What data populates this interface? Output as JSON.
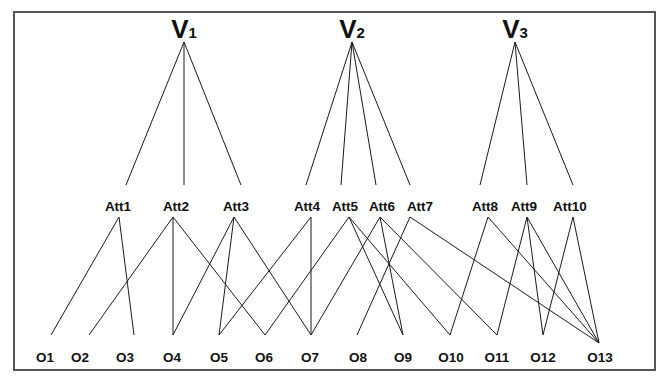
{
  "diagram": {
    "frame": {
      "x": 14,
      "y": 12,
      "width": 641,
      "height": 358,
      "stroke": "#555555"
    },
    "edge_color": "#1a1a1a",
    "views": [
      {
        "id": "V1",
        "letter": "V",
        "sub": "1",
        "label_x": 184,
        "apex": [
          184,
          42
        ]
      },
      {
        "id": "V2",
        "letter": "V",
        "sub": "2",
        "label_x": 352,
        "apex": [
          352,
          42
        ]
      },
      {
        "id": "V3",
        "letter": "V",
        "sub": "3",
        "label_x": 515,
        "apex": [
          515,
          42
        ]
      }
    ],
    "attributes": [
      {
        "id": "Att1",
        "label": "Att1",
        "label_x": 118,
        "top": [
          126,
          185
        ],
        "bottom": [
          119,
          217
        ]
      },
      {
        "id": "Att2",
        "label": "Att2",
        "label_x": 176,
        "top": [
          184,
          185
        ],
        "bottom": [
          173,
          217
        ]
      },
      {
        "id": "Att3",
        "label": "Att3",
        "label_x": 236,
        "top": [
          241,
          185
        ],
        "bottom": [
          234,
          217
        ]
      },
      {
        "id": "Att4",
        "label": "Att4",
        "label_x": 307,
        "top": [
          306,
          185
        ],
        "bottom": [
          311,
          217
        ]
      },
      {
        "id": "Att5",
        "label": "Att5",
        "label_x": 345,
        "top": [
          341,
          185
        ],
        "bottom": [
          349,
          217
        ]
      },
      {
        "id": "Att6",
        "label": "Att6",
        "label_x": 382,
        "top": [
          376,
          185
        ],
        "bottom": [
          380,
          217
        ]
      },
      {
        "id": "Att7",
        "label": "Att7",
        "label_x": 420,
        "top": [
          410,
          185
        ],
        "bottom": [
          410,
          217
        ]
      },
      {
        "id": "Att8",
        "label": "Att8",
        "label_x": 485,
        "top": [
          480,
          185
        ],
        "bottom": [
          488,
          217
        ]
      },
      {
        "id": "Att9",
        "label": "Att9",
        "label_x": 524,
        "top": [
          527,
          185
        ],
        "bottom": [
          527,
          217
        ]
      },
      {
        "id": "Att10",
        "label": "Att10",
        "label_x": 570,
        "top": [
          573,
          185
        ],
        "bottom": [
          573,
          217
        ]
      }
    ],
    "objects": [
      {
        "id": "O1",
        "label": "O1",
        "label_x": 45,
        "point": [
          51,
          335
        ]
      },
      {
        "id": "O2",
        "label": "O2",
        "label_x": 80,
        "point": [
          89,
          335
        ]
      },
      {
        "id": "O3",
        "label": "O3",
        "label_x": 125,
        "point": [
          134,
          335
        ]
      },
      {
        "id": "O4",
        "label": "O4",
        "label_x": 172,
        "point": [
          173,
          335
        ]
      },
      {
        "id": "O5",
        "label": "O5",
        "label_x": 219,
        "point": [
          219,
          335
        ]
      },
      {
        "id": "O6",
        "label": "O6",
        "label_x": 264,
        "point": [
          265,
          335
        ]
      },
      {
        "id": "O7",
        "label": "O7",
        "label_x": 310,
        "point": [
          311,
          335
        ]
      },
      {
        "id": "O8",
        "label": "O8",
        "label_x": 358,
        "point": [
          357,
          335
        ]
      },
      {
        "id": "O9",
        "label": "O9",
        "label_x": 403,
        "point": [
          403,
          335
        ]
      },
      {
        "id": "O10",
        "label": "O10",
        "label_x": 451,
        "point": [
          450,
          335
        ]
      },
      {
        "id": "O11",
        "label": "O11",
        "label_x": 497,
        "point": [
          497,
          335
        ]
      },
      {
        "id": "O12",
        "label": "O12",
        "label_x": 543,
        "point": [
          543,
          335
        ]
      },
      {
        "id": "O13",
        "label": "O13",
        "label_x": 600,
        "point": [
          599,
          343
        ]
      }
    ],
    "view_edges": [
      [
        "V1",
        "Att1"
      ],
      [
        "V1",
        "Att2"
      ],
      [
        "V1",
        "Att3"
      ],
      [
        "V2",
        "Att4"
      ],
      [
        "V2",
        "Att5"
      ],
      [
        "V2",
        "Att6"
      ],
      [
        "V2",
        "Att7"
      ],
      [
        "V3",
        "Att8"
      ],
      [
        "V3",
        "Att9"
      ],
      [
        "V3",
        "Att10"
      ]
    ],
    "attribute_edges": [
      [
        "Att1",
        "O1"
      ],
      [
        "Att1",
        "O3"
      ],
      [
        "Att2",
        "O2"
      ],
      [
        "Att2",
        "O4"
      ],
      [
        "Att2",
        "O6"
      ],
      [
        "Att3",
        "O4"
      ],
      [
        "Att3",
        "O5"
      ],
      [
        "Att3",
        "O7"
      ],
      [
        "Att4",
        "O5"
      ],
      [
        "Att4",
        "O7"
      ],
      [
        "Att5",
        "O6"
      ],
      [
        "Att5",
        "O9"
      ],
      [
        "Att5",
        "O10"
      ],
      [
        "Att6",
        "O7"
      ],
      [
        "Att6",
        "O9"
      ],
      [
        "Att6",
        "O11"
      ],
      [
        "Att7",
        "O8"
      ],
      [
        "Att7",
        "O13"
      ],
      [
        "Att8",
        "O10"
      ],
      [
        "Att8",
        "O13"
      ],
      [
        "Att9",
        "O11"
      ],
      [
        "Att9",
        "O12"
      ],
      [
        "Att9",
        "O13"
      ],
      [
        "Att10",
        "O12"
      ],
      [
        "Att10",
        "O13"
      ]
    ],
    "label_rows": {
      "view_y": 38,
      "attribute_y": 211,
      "object_y": 362
    }
  }
}
